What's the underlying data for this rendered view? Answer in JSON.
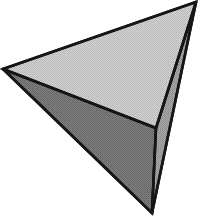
{
  "figure": {
    "background_color": "#ffffff",
    "outline_color": "#161616",
    "outline_width": 2.6,
    "canvas": {
      "width": 202,
      "height": 216
    },
    "vertices": [
      {
        "name": "left-vertex",
        "x": 3,
        "y": 69
      },
      {
        "name": "top-right-vertex",
        "x": 196,
        "y": 2
      },
      {
        "name": "bottom-vertex",
        "x": 152,
        "y": 213
      },
      {
        "name": "interior-vertex",
        "x": 156,
        "y": 128
      }
    ],
    "faces": [
      {
        "name": "top-face",
        "label": "Upper light face",
        "fill": "#c9c9c9",
        "points": "3,69 196,2 156,128"
      },
      {
        "name": "left-face",
        "label": "Lower-left dark face",
        "fill": "#767676",
        "points": "3,69 156,128 152,213"
      },
      {
        "name": "right-face",
        "label": "Right narrow mid face",
        "fill": "#9b9b9b",
        "points": "196,2 156,128 152,213"
      }
    ],
    "edges": [
      {
        "name": "edge-left-to-top",
        "from": "left-vertex",
        "to": "top-right-vertex"
      },
      {
        "name": "edge-left-to-interior",
        "from": "left-vertex",
        "to": "interior-vertex"
      },
      {
        "name": "edge-left-to-bottom",
        "from": "left-vertex",
        "to": "bottom-vertex"
      },
      {
        "name": "edge-top-to-interior",
        "from": "top-right-vertex",
        "to": "interior-vertex"
      },
      {
        "name": "edge-top-to-bottom",
        "from": "top-right-vertex",
        "to": "bottom-vertex"
      },
      {
        "name": "edge-interior-to-bottom",
        "from": "interior-vertex",
        "to": "bottom-vertex"
      }
    ]
  }
}
